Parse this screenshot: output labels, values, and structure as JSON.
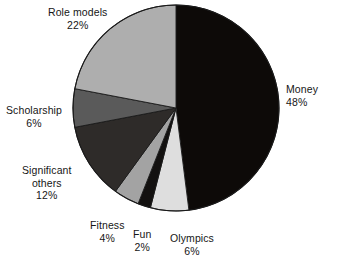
{
  "chart_data": {
    "type": "pie",
    "title": "",
    "subtitle": "",
    "xlabel": "",
    "ylabel": "",
    "legend_position": "none",
    "grid": false,
    "units": "percent",
    "start_angle_deg": 0,
    "direction": "clockwise",
    "categories": [
      "Money",
      "Olympics",
      "Fun",
      "Fitness",
      "Significant others",
      "Scholarship",
      "Role models"
    ],
    "values": [
      48,
      6,
      2,
      4,
      12,
      6,
      22
    ],
    "slices": [
      {
        "id": "money",
        "label": "Money",
        "value": 48,
        "value_text": "48%",
        "color": "#0d0a08",
        "label_lines": [
          "Money",
          "48%"
        ]
      },
      {
        "id": "olympics",
        "label": "Olympics",
        "value": 6,
        "value_text": "6%",
        "color": "#dedede",
        "label_lines": [
          "Olympics",
          "6%"
        ]
      },
      {
        "id": "fun",
        "label": "Fun",
        "value": 2,
        "value_text": "2%",
        "color": "#131110",
        "label_lines": [
          "Fun",
          "2%"
        ]
      },
      {
        "id": "fitness",
        "label": "Fitness",
        "value": 4,
        "value_text": "4%",
        "color": "#a3a3a3",
        "label_lines": [
          "Fitness",
          "4%"
        ]
      },
      {
        "id": "significant-others",
        "label": "Significant others",
        "value": 12,
        "value_text": "12%",
        "color": "#2e2b29",
        "label_lines": [
          "Significant",
          "others",
          "12%"
        ]
      },
      {
        "id": "scholarship",
        "label": "Scholarship",
        "value": 6,
        "value_text": "6%",
        "color": "#5a5a5a",
        "label_lines": [
          "Scholarship",
          "6%"
        ]
      },
      {
        "id": "role-models",
        "label": "Role models",
        "value": 22,
        "value_text": "22%",
        "color": "#aeaeae",
        "label_lines": [
          "Role models",
          "22%"
        ]
      }
    ]
  },
  "labels": {
    "role_models_name": "Role models",
    "role_models_pct": "22%",
    "money_name": "Money",
    "money_pct": "48%",
    "scholarship_name": "Scholarship",
    "scholarship_pct": "6%",
    "significant_name1": "Significant",
    "significant_name2": "others",
    "significant_pct": "12%",
    "fitness_name": "Fitness",
    "fitness_pct": "4%",
    "fun_name": "Fun",
    "fun_pct": "2%",
    "olympics_name": "Olympics",
    "olympics_pct": "6%"
  },
  "geometry": {
    "center_x": 176,
    "center_y": 108,
    "radius": 103,
    "outline_color": "#1a1a1a"
  }
}
